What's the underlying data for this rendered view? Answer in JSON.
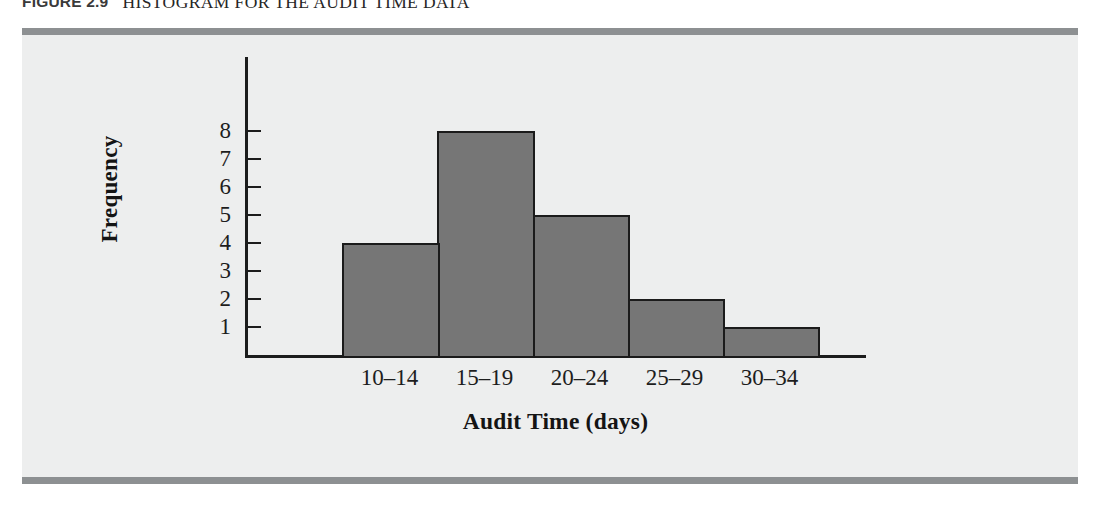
{
  "figure": {
    "label": "FIGURE 2.9",
    "title": "HISTOGRAM FOR THE AUDIT TIME DATA"
  },
  "colors": {
    "panel_background": "#edeeee",
    "panel_rule": "#8d9092",
    "bar_fill": "#767676",
    "bar_border": "#1b1b1b",
    "axis": "#1c1c1c",
    "text": "#1d1d1d",
    "page_background": "#ffffff"
  },
  "chart_data": {
    "type": "bar",
    "title": "HISTOGRAM FOR THE AUDIT TIME DATA",
    "categories": [
      "10–14",
      "15–19",
      "20–24",
      "25–29",
      "30–34"
    ],
    "values": [
      4,
      8,
      5,
      2,
      1
    ],
    "xlabel": "Audit Time (days)",
    "ylabel": "Frequency",
    "ylim": [
      0,
      8.6
    ],
    "yticks": [
      1,
      2,
      3,
      4,
      5,
      6,
      7,
      8
    ],
    "ytick_labels": [
      "1",
      "2",
      "3",
      "4",
      "5",
      "6",
      "7",
      "8"
    ],
    "grid": false,
    "legend": false,
    "bars_contiguous": true
  }
}
